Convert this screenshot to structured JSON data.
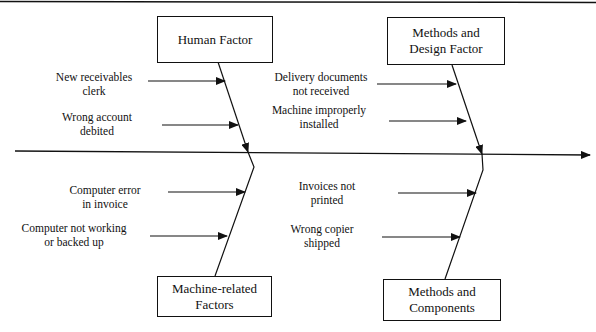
{
  "diagram": {
    "type": "fishbone",
    "spine_direction": "right",
    "categories": [
      {
        "id": "human",
        "label_lines": [
          "Human Factor"
        ],
        "position": "top-left",
        "causes": [
          {
            "lines": [
              "New receivables",
              "clerk"
            ]
          },
          {
            "lines": [
              "Wrong account",
              "debited"
            ]
          }
        ]
      },
      {
        "id": "methods-design",
        "label_lines": [
          "Methods and",
          "Design Factor"
        ],
        "position": "top-right",
        "causes": [
          {
            "lines": [
              "Delivery documents",
              "not received"
            ]
          },
          {
            "lines": [
              "Machine improperly",
              "installed"
            ]
          }
        ]
      },
      {
        "id": "machine",
        "label_lines": [
          "Machine-related",
          "Factors"
        ],
        "position": "bottom-left",
        "causes": [
          {
            "lines": [
              "Computer error",
              "in invoice"
            ]
          },
          {
            "lines": [
              "Computer not working",
              "or backed up"
            ]
          }
        ]
      },
      {
        "id": "methods-components",
        "label_lines": [
          "Methods and",
          "Components"
        ],
        "position": "bottom-right",
        "causes": [
          {
            "lines": [
              "Invoices not",
              "printed"
            ]
          },
          {
            "lines": [
              "Wrong copier",
              "shipped"
            ]
          }
        ]
      }
    ]
  }
}
